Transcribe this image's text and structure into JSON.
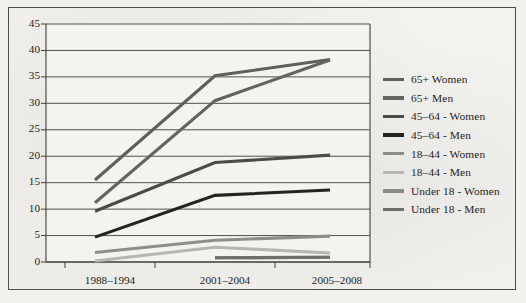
{
  "chart_data": {
    "type": "line",
    "title": "",
    "subtitle": "",
    "xlabel": "",
    "ylabel": "",
    "categories": [
      "1988–1994",
      "2001–2004",
      "2005–2008"
    ],
    "ylim": [
      0,
      45
    ],
    "yticks": [
      0,
      5,
      10,
      15,
      20,
      25,
      30,
      35,
      40,
      45
    ],
    "ytick_labels": [
      "0",
      "5",
      "10",
      "15",
      "20",
      "25",
      "30",
      "35",
      "40",
      "45"
    ],
    "grid": true,
    "grid_axis": "y",
    "legend_position": "right",
    "series": [
      {
        "name": "65+ Women",
        "values": [
          15.5,
          35.2,
          38.3
        ],
        "color": "#5f5f5d"
      },
      {
        "name": "65+ Men",
        "values": [
          11.2,
          30.5,
          38.2
        ],
        "color": "#63635f"
      },
      {
        "name": "45–64 - Women",
        "values": [
          9.6,
          18.8,
          20.2
        ],
        "color": "#4b4b49"
      },
      {
        "name": "45–64 - Men",
        "values": [
          4.7,
          12.6,
          13.6
        ],
        "color": "#232322"
      },
      {
        "name": "18–44 - Women",
        "values": [
          1.8,
          4.1,
          4.9
        ],
        "color": "#8d8d8a"
      },
      {
        "name": "18–44 - Men",
        "values": [
          0.2,
          2.8,
          1.7
        ],
        "color": "#b6b6b2"
      },
      {
        "name": "Under 18 - Women",
        "values": [
          null,
          0.8,
          0.9
        ],
        "color": "#8a8a87"
      },
      {
        "name": "Under 18 - Men",
        "values": [
          null,
          0.8,
          0.9
        ],
        "color": "#6e6e6b"
      }
    ]
  },
  "legend": {
    "items": [
      {
        "label": "65+ Women"
      },
      {
        "label": "65+ Men"
      },
      {
        "label": "45–64 - Women"
      },
      {
        "label": "45–64 - Men"
      },
      {
        "label": "18–44 - Women"
      },
      {
        "label": "18–44 - Men"
      },
      {
        "label": "Under 18 - Women"
      },
      {
        "label": "Under 18 - Men"
      }
    ]
  },
  "axes": {
    "y_ticks": [
      "45",
      "40",
      "35",
      "30",
      "25",
      "20",
      "15",
      "10",
      "5",
      "0"
    ],
    "x_ticks": [
      "1988–1994",
      "2001–2004",
      "2005–2008"
    ]
  }
}
